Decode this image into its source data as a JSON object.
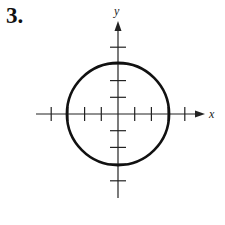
{
  "problem": {
    "number_label": "3."
  },
  "diagram": {
    "type": "circle-on-axes",
    "x_axis_label": "x",
    "y_axis_label": "y",
    "origin_px": [
      118,
      114
    ],
    "unit_px": 16.7,
    "x_ticks": [
      -4,
      -3,
      -2,
      -1,
      1,
      2,
      3,
      4
    ],
    "y_ticks": [
      -4,
      -3,
      -2,
      -1,
      1,
      2,
      3,
      4
    ],
    "circle": {
      "center": [
        0,
        0
      ],
      "radius": 3
    },
    "stroke_color": "#111111"
  }
}
